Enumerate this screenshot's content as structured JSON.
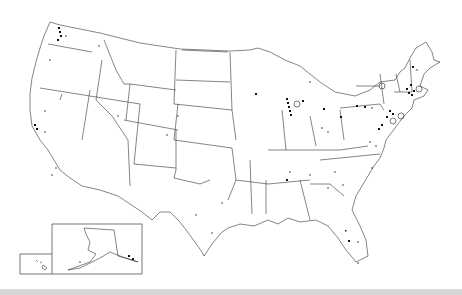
{
  "map": {
    "title": "",
    "subject": "United States map with state boundaries and point markers",
    "regions_shown": [
      "Contiguous United States",
      "Alaska (inset)",
      "Hawaii (inset)"
    ],
    "marker_types": [
      "filled-square",
      "small-dot",
      "open-circle"
    ],
    "colors": {
      "background": "#ffffff",
      "outline": "#333333",
      "marker": "#111111",
      "bottom_band": "#d6d6d6"
    },
    "marker_clusters": [
      {
        "region": "Washington (Puget Sound)",
        "density": "high"
      },
      {
        "region": "California (Bay Area)",
        "density": "medium"
      },
      {
        "region": "Southern California",
        "density": "low"
      },
      {
        "region": "Illinois / Chicago area",
        "density": "high"
      },
      {
        "region": "Michigan",
        "density": "medium"
      },
      {
        "region": "Ohio",
        "density": "low"
      },
      {
        "region": "Pennsylvania",
        "density": "medium"
      },
      {
        "region": "New York / New Jersey",
        "density": "high"
      },
      {
        "region": "Massachusetts / Boston area",
        "density": "high"
      },
      {
        "region": "Maine",
        "density": "low"
      },
      {
        "region": "Maryland / Virginia",
        "density": "medium"
      },
      {
        "region": "Tennessee",
        "density": "low"
      },
      {
        "region": "Georgia / Carolinas",
        "density": "low"
      },
      {
        "region": "Florida",
        "density": "medium"
      },
      {
        "region": "Texas",
        "density": "low"
      },
      {
        "region": "Alaska (southeast)",
        "density": "medium"
      }
    ]
  }
}
